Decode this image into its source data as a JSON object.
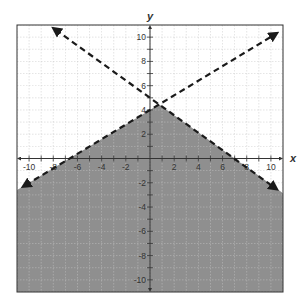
{
  "chart_data": {
    "type": "inequality-graph",
    "title": "",
    "xlabel": "x",
    "ylabel": "y",
    "xlim": [
      -11,
      11
    ],
    "ylim": [
      -11,
      11
    ],
    "grid": true,
    "grid_step": 1,
    "x_tick_labels": [
      "-10",
      "-8",
      "-6",
      "-4",
      "-2",
      "2",
      "4",
      "6",
      "8",
      "10"
    ],
    "y_tick_labels": [
      "10",
      "8",
      "6",
      "4",
      "2",
      "-2",
      "-4",
      "-6",
      "-8",
      "-10"
    ],
    "x_tick_values": [
      -10,
      -8,
      -6,
      -4,
      -2,
      2,
      4,
      6,
      8,
      10
    ],
    "y_tick_values": [
      10,
      8,
      6,
      4,
      2,
      -2,
      -4,
      -6,
      -8,
      -10
    ],
    "series": [
      {
        "name": "boundary-line-descending",
        "equation": "y = -5/7 x + 5",
        "slope": -0.714,
        "intercept": 5,
        "style": "dashed",
        "endpoints": [
          [
            -7.8,
            10.6
          ],
          [
            10.3,
            -2.4
          ]
        ],
        "arrows": "both"
      },
      {
        "name": "boundary-line-ascending",
        "equation": "y = 3/5 x + 4",
        "slope": 0.6,
        "intercept": 4,
        "style": "dashed",
        "endpoints": [
          [
            -10.3,
            -2.2
          ],
          [
            10.3,
            10.2
          ]
        ],
        "arrows": "both"
      }
    ],
    "shaded_region": {
      "description": "below both dashed lines",
      "inequalities": [
        "y < 3/5 x + 4",
        "y < -5/7 x + 5"
      ],
      "vertex": [
        0.76,
        4.46
      ]
    },
    "colors": {
      "shade": "#8f8f8f",
      "grid": "#c8c8c8",
      "line": "#1a1a1a",
      "border": "#333333"
    }
  }
}
